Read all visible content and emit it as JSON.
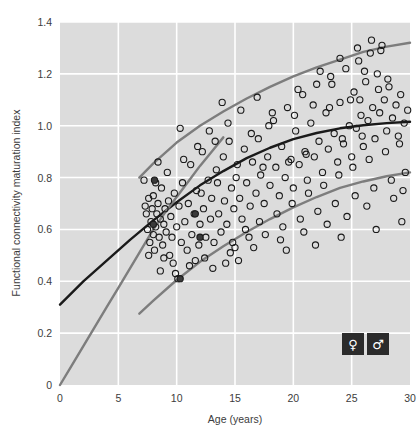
{
  "chart_data": {
    "type": "scatter",
    "title": "",
    "xlabel": "Age (years)",
    "ylabel": "Functional connectivity maturation index",
    "xlim": [
      0,
      30
    ],
    "ylim": [
      0,
      1.4
    ],
    "xticks": [
      0,
      5,
      10,
      15,
      20,
      25,
      30
    ],
    "xticklabels": [
      "0",
      "5",
      "10",
      "15",
      "20",
      "25",
      "30"
    ],
    "yticks": [
      0,
      0.2,
      0.4,
      0.6,
      0.8,
      1.0,
      1.2,
      1.4
    ],
    "yticklabels": [
      "0",
      "0.2",
      "0.4",
      "0.6",
      "0.8",
      "1.0",
      "1.2",
      "1.4"
    ],
    "grid": true,
    "grid_color": "#ffffff",
    "plot_background": "#dcdcdc",
    "marker": "open-circle",
    "marker_edge_color": "#1a1a1a",
    "marker_face_color": "none",
    "legend_position": "bottom-right",
    "legend": [
      {
        "name": "female",
        "symbol": "♀"
      },
      {
        "name": "male",
        "symbol": "♂"
      }
    ],
    "series": [
      {
        "name": "participants",
        "type": "scatter",
        "points": [
          [
            7.2,
            0.79
          ],
          [
            7.4,
            0.66
          ],
          [
            7.5,
            0.6
          ],
          [
            7.6,
            0.72
          ],
          [
            7.7,
            0.55
          ],
          [
            7.8,
            0.63
          ],
          [
            7.9,
            0.68
          ],
          [
            8.0,
            0.58
          ],
          [
            8.0,
            0.73
          ],
          [
            8.1,
            0.52
          ],
          [
            8.2,
            0.61
          ],
          [
            8.3,
            0.66
          ],
          [
            8.4,
            0.7
          ],
          [
            8.5,
            0.57
          ],
          [
            8.6,
            0.64
          ],
          [
            8.7,
            0.76
          ],
          [
            8.8,
            0.54
          ],
          [
            8.9,
            0.62
          ],
          [
            9.0,
            0.68
          ],
          [
            9.1,
            0.59
          ],
          [
            9.2,
            0.82
          ],
          [
            9.3,
            0.71
          ],
          [
            9.4,
            0.5
          ],
          [
            9.5,
            0.65
          ],
          [
            9.6,
            0.57
          ],
          [
            9.8,
            0.74
          ],
          [
            10.0,
            0.61
          ],
          [
            10.1,
            0.41
          ],
          [
            10.2,
            0.69
          ],
          [
            10.4,
            0.55
          ],
          [
            10.5,
            0.78
          ],
          [
            10.7,
            0.63
          ],
          [
            10.9,
            0.52
          ],
          [
            11.0,
            0.7
          ],
          [
            11.2,
            0.85
          ],
          [
            11.3,
            0.58
          ],
          [
            11.5,
            0.66
          ],
          [
            11.7,
            0.75
          ],
          [
            11.9,
            0.54
          ],
          [
            12.0,
            0.62
          ],
          [
            12.2,
            0.9
          ],
          [
            12.3,
            0.68
          ],
          [
            12.5,
            0.57
          ],
          [
            12.7,
            0.79
          ],
          [
            12.9,
            0.64
          ],
          [
            13.0,
            0.72
          ],
          [
            13.2,
            0.55
          ],
          [
            13.4,
            0.83
          ],
          [
            13.6,
            0.66
          ],
          [
            13.8,
            0.59
          ],
          [
            14.0,
            0.88
          ],
          [
            14.1,
            0.71
          ],
          [
            14.3,
            0.62
          ],
          [
            14.5,
            0.94
          ],
          [
            14.7,
            0.76
          ],
          [
            14.9,
            0.68
          ],
          [
            15.0,
            0.53
          ],
          [
            15.2,
            0.85
          ],
          [
            15.4,
            0.72
          ],
          [
            15.6,
            0.64
          ],
          [
            15.8,
            0.91
          ],
          [
            16.0,
            0.78
          ],
          [
            16.3,
            0.69
          ],
          [
            16.5,
            0.86
          ],
          [
            16.8,
            0.74
          ],
          [
            17.0,
            0.95
          ],
          [
            17.2,
            0.81
          ],
          [
            17.5,
            0.7
          ],
          [
            17.8,
            0.88
          ],
          [
            18.0,
            0.77
          ],
          [
            18.3,
            1.02
          ],
          [
            18.5,
            0.84
          ],
          [
            18.8,
            0.73
          ],
          [
            19.0,
            0.92
          ],
          [
            19.3,
            0.8
          ],
          [
            19.5,
            1.07
          ],
          [
            19.8,
            0.87
          ],
          [
            20.0,
            0.76
          ],
          [
            20.2,
            0.98
          ],
          [
            20.5,
            0.85
          ],
          [
            20.8,
            1.12
          ],
          [
            21.0,
            0.9
          ],
          [
            21.2,
            0.79
          ],
          [
            21.5,
            1.01
          ],
          [
            21.8,
            0.88
          ],
          [
            22.0,
            1.16
          ],
          [
            22.2,
            0.94
          ],
          [
            22.5,
            0.82
          ],
          [
            22.8,
            1.05
          ],
          [
            23.0,
            0.91
          ],
          [
            23.2,
            1.19
          ],
          [
            23.5,
            0.97
          ],
          [
            23.8,
            0.86
          ],
          [
            24.0,
            1.09
          ],
          [
            24.2,
            0.95
          ],
          [
            24.5,
            1.22
          ],
          [
            24.8,
            1.0
          ],
          [
            25.0,
            0.88
          ],
          [
            25.2,
            1.13
          ],
          [
            25.4,
            0.99
          ],
          [
            25.6,
            1.25
          ],
          [
            25.8,
            1.04
          ],
          [
            26.0,
            0.92
          ],
          [
            26.2,
            1.17
          ],
          [
            26.4,
            1.02
          ],
          [
            26.6,
            1.28
          ],
          [
            26.8,
            1.07
          ],
          [
            27.0,
            0.95
          ],
          [
            27.2,
            1.2
          ],
          [
            27.4,
            1.05
          ],
          [
            27.6,
            1.31
          ],
          [
            27.8,
            1.1
          ],
          [
            28.0,
            0.98
          ],
          [
            28.2,
            1.15
          ],
          [
            28.5,
            1.03
          ],
          [
            28.8,
            1.08
          ],
          [
            29.0,
            0.96
          ],
          [
            29.2,
            1.12
          ],
          [
            29.5,
            1.01
          ],
          [
            29.8,
            1.06
          ],
          [
            8.4,
            0.86
          ],
          [
            9.7,
            0.47
          ],
          [
            11.1,
            0.46
          ],
          [
            12.4,
            0.49
          ],
          [
            13.1,
            0.45
          ],
          [
            14.6,
            0.51
          ],
          [
            15.9,
            0.6
          ],
          [
            17.1,
            0.63
          ],
          [
            18.6,
            0.66
          ],
          [
            19.9,
            0.7
          ],
          [
            21.3,
            0.74
          ],
          [
            22.6,
            0.77
          ],
          [
            23.9,
            0.81
          ],
          [
            25.1,
            0.84
          ],
          [
            26.5,
            0.87
          ],
          [
            27.9,
            0.9
          ],
          [
            29.1,
            0.93
          ],
          [
            10.3,
            0.99
          ],
          [
            12.8,
            0.98
          ],
          [
            14.4,
            1.01
          ],
          [
            16.2,
            0.57
          ],
          [
            17.6,
            0.58
          ],
          [
            19.1,
            0.61
          ],
          [
            20.6,
            0.64
          ],
          [
            22.1,
            0.67
          ],
          [
            23.6,
            0.7
          ],
          [
            25.3,
            0.73
          ],
          [
            26.9,
            0.76
          ],
          [
            28.4,
            0.79
          ],
          [
            29.6,
            0.82
          ],
          [
            13.9,
            1.09
          ],
          [
            15.5,
            1.06
          ],
          [
            16.9,
            1.11
          ],
          [
            18.2,
            1.05
          ],
          [
            20.4,
            1.14
          ],
          [
            21.7,
            1.08
          ],
          [
            23.3,
            1.16
          ],
          [
            24.9,
            1.1
          ],
          [
            26.1,
            1.21
          ],
          [
            27.3,
            1.14
          ],
          [
            8.6,
            0.44
          ],
          [
            9.9,
            0.43
          ],
          [
            11.6,
            0.48
          ],
          [
            14.8,
            0.55
          ],
          [
            16.6,
            0.53
          ],
          [
            18.9,
            0.56
          ],
          [
            20.9,
            0.59
          ],
          [
            22.9,
            0.62
          ],
          [
            24.6,
            0.65
          ],
          [
            26.3,
            0.69
          ],
          [
            28.6,
            0.72
          ],
          [
            29.4,
            0.75
          ],
          [
            12.1,
            0.74
          ],
          [
            13.5,
            0.78
          ],
          [
            15.1,
            0.8
          ],
          [
            17.4,
            0.84
          ],
          [
            19.6,
            0.86
          ],
          [
            21.1,
            0.89
          ],
          [
            24.3,
            0.93
          ],
          [
            25.9,
            0.96
          ],
          [
            7.3,
            0.69
          ],
          [
            7.6,
            0.5
          ],
          [
            8.2,
            0.78
          ],
          [
            8.9,
            0.49
          ],
          [
            10.6,
            0.87
          ],
          [
            11.8,
            0.92
          ],
          [
            13.3,
            0.94
          ],
          [
            14.2,
            0.47
          ],
          [
            15.3,
            0.48
          ],
          [
            16.4,
            0.97
          ],
          [
            17.9,
            1.0
          ],
          [
            19.4,
            0.52
          ],
          [
            20.1,
            1.04
          ],
          [
            21.9,
            0.54
          ],
          [
            23.1,
            1.07
          ],
          [
            24.1,
            0.57
          ],
          [
            25.7,
            1.1
          ],
          [
            27.1,
            0.6
          ],
          [
            28.1,
            1.18
          ],
          [
            29.3,
            0.63
          ],
          [
            26.7,
            1.33
          ],
          [
            27.5,
            1.29
          ],
          [
            25.5,
            1.3
          ],
          [
            24.0,
            1.26
          ],
          [
            22.3,
            1.21
          ]
        ],
        "filled_points": [
          [
            8.1,
            0.79
          ],
          [
            10.3,
            0.41
          ],
          [
            11.6,
            0.66
          ],
          [
            12.0,
            0.57
          ],
          [
            8.0,
            0.62
          ]
        ]
      },
      {
        "name": "fit-mean",
        "type": "line",
        "color": "#1a1a1a",
        "width": 2.4,
        "x": [
          0,
          2,
          4,
          6,
          8,
          10,
          12,
          14,
          16,
          18,
          20,
          22,
          24,
          26,
          28,
          30
        ],
        "y": [
          0.31,
          0.4,
          0.48,
          0.56,
          0.635,
          0.705,
          0.77,
          0.825,
          0.875,
          0.915,
          0.948,
          0.972,
          0.99,
          1.002,
          1.01,
          1.015
        ]
      },
      {
        "name": "fit-upper-band",
        "type": "line",
        "color": "#7d7d7d",
        "width": 2.4,
        "x": [
          6.8,
          8,
          10,
          12,
          14,
          16,
          18,
          20,
          22,
          24,
          26,
          28,
          30
        ],
        "y": [
          0.8,
          0.855,
          0.935,
          1.0,
          1.055,
          1.105,
          1.15,
          1.19,
          1.225,
          1.255,
          1.285,
          1.305,
          1.32
        ]
      },
      {
        "name": "fit-lower-band",
        "type": "line",
        "color": "#7d7d7d",
        "width": 2.4,
        "x": [
          6.8,
          8,
          10,
          12,
          14,
          16,
          18,
          20,
          22,
          24,
          26,
          28,
          30
        ],
        "y": [
          0.275,
          0.325,
          0.405,
          0.475,
          0.535,
          0.59,
          0.64,
          0.685,
          0.725,
          0.76,
          0.785,
          0.805,
          0.82
        ]
      },
      {
        "name": "fit-steep-lower",
        "type": "line",
        "color": "#7d7d7d",
        "width": 2.4,
        "x": [
          0,
          1,
          2,
          3,
          4,
          5,
          6,
          7,
          8,
          9,
          10,
          11,
          12,
          13,
          14
        ],
        "y": [
          0.0,
          0.075,
          0.15,
          0.225,
          0.3,
          0.375,
          0.45,
          0.525,
          0.6,
          0.665,
          0.725,
          0.785,
          0.845,
          0.9,
          0.955
        ]
      }
    ]
  }
}
